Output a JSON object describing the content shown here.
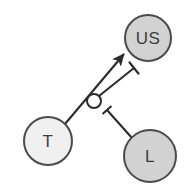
{
  "diagram": {
    "type": "causal-signaling-diagram",
    "background_color": "#ffffff",
    "stroke_color": "#2b2b2b",
    "label_color": "#3c3c3c",
    "nodes": [
      {
        "id": "us",
        "label": "US",
        "shape": "circle",
        "cx": 148,
        "cy": 38,
        "r": 23,
        "fill": "#d2d2d2",
        "stroke": "#4a4a4a",
        "font_size": 17
      },
      {
        "id": "t",
        "label": "T",
        "shape": "circle",
        "cx": 48,
        "cy": 141,
        "r": 24,
        "fill": "#f0f0f0",
        "stroke": "#4a4a4a",
        "font_size": 17
      },
      {
        "id": "l",
        "label": "L",
        "shape": "circle",
        "cx": 150,
        "cy": 156,
        "r": 26,
        "fill": "#d2d2d2",
        "stroke": "#4a4a4a",
        "font_size": 17
      },
      {
        "id": "junction",
        "label": "",
        "shape": "circle",
        "cx": 94,
        "cy": 101,
        "r": 7,
        "fill": "#ffffff",
        "stroke": "#2b2b2b",
        "font_size": 0
      }
    ],
    "edges": [
      {
        "id": "t-activates-us",
        "from": "t",
        "to": "us",
        "marker": "arrow",
        "meaning": "activation",
        "x1": 65,
        "y1": 124,
        "x2": 124,
        "y2": 54
      },
      {
        "id": "junction-inhibits-t-us",
        "from": "junction",
        "to": "t-activates-us",
        "marker": "bar",
        "meaning": "inhibition",
        "x1": 99,
        "y1": 96,
        "x2": 134,
        "y2": 68,
        "bar_half_length": 8
      },
      {
        "id": "l-inhibits-junction",
        "from": "l",
        "to": "junction",
        "marker": "bar",
        "meaning": "inhibition",
        "x1": 132,
        "y1": 138,
        "x2": 107,
        "y2": 110,
        "bar_half_length": 6
      }
    ],
    "legend": {
      "arrow_meaning": "activation",
      "bar_meaning": "inhibition"
    }
  }
}
